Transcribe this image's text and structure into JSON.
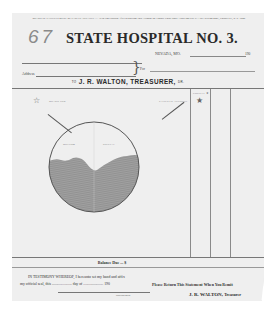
{
  "document": {
    "notice": "BOARD OF PATIENTS MUST BE PAID IN ADVANCE — As to Cost Sustain After Rendering This Account the County Court Shall Allow and Pay It.—See Section 4891, Chapter 53, R. S. 1899.",
    "handwritten_number": "67",
    "title": "STATE HOSPITAL NO. 3.",
    "location": "NEVADA, MO.",
    "year_prefix_top": "190",
    "for_label": "For",
    "address_label": "Address",
    "treasurer_prefix": "TO",
    "treasurer_name": "J. R. WALTON, TREASURER,",
    "treasurer_suffix": "DR.",
    "ledger": {
      "left_caption": "BOARD FOR",
      "right_caption": "PATIENT'S ACCOUNT",
      "column_caption": "COUNTY ★",
      "circle_labels": [
        "BOTTOM",
        "SPECIAL"
      ]
    },
    "balance_label": "Balance Due ... $",
    "witness_line1": "IN TESTIMONY WHEREOF, I hereunto set my hand and affix",
    "witness_line2": "my official seal, this ..................... day of ..................... 190",
    "signature_caption": "Superintendent",
    "return_note": "Please Return This Statement When You Remit",
    "signatory": "J. R. WALTON,",
    "signatory_title": "Treasurer"
  },
  "colors": {
    "paper": "#efefef",
    "ink": "#2a2a2a",
    "pencil_shading": "#9a9a9a"
  }
}
